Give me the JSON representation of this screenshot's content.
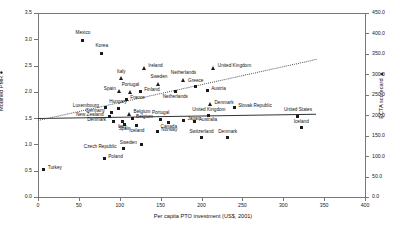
{
  "chart_data": {
    "type": "scatter",
    "title": "",
    "xlabel": "Per capita PTO investment (US$, 2001)",
    "ylabel": "Modified PMR ●",
    "y2label": "ECTA scorecard ▲",
    "xlim": [
      0,
      400
    ],
    "ylim": [
      0.0,
      3.5
    ],
    "y2lim": [
      0.0,
      450.0
    ],
    "xticks": [
      "0",
      "50",
      "100",
      "150",
      "200",
      "250",
      "300",
      "350",
      "400"
    ],
    "yticks": [
      "0.0",
      "0.5",
      "1.0",
      "1.5",
      "2.0",
      "2.5",
      "3.0",
      "3.5"
    ],
    "y2ticks": [
      "0.0",
      "50.0",
      "100.0",
      "150.0",
      "200.0",
      "250.0",
      "300.0",
      "350.0",
      "400.0",
      "450.0"
    ],
    "grid": false,
    "legend": "none",
    "series": [
      {
        "name": "Modified PMR",
        "marker": "square",
        "axis": "left",
        "points": [
          {
            "label": "Mexico",
            "x": 55,
            "y": 2.98,
            "lx": -1,
            "ly": -7
          },
          {
            "label": "Korea",
            "x": 78,
            "y": 2.73,
            "lx": -1,
            "ly": -7
          },
          {
            "label": "Finland",
            "x": 125,
            "y": 2.0,
            "lx": 4,
            "ly": -1.5
          },
          {
            "label": "Netherlands",
            "x": 168,
            "y": 2.0,
            "lx": -1,
            "ly": 5
          },
          {
            "label": "Greece",
            "x": 193,
            "y": 2.1,
            "lx": -1,
            "ly": -6
          },
          {
            "label": "Austria",
            "x": 207,
            "y": 2.02,
            "lx": 4,
            "ly": -1.5
          },
          {
            "label": "France",
            "x": 108,
            "y": 1.85,
            "lx": 4,
            "ly": -1.5
          },
          {
            "label": "Luxembourg",
            "x": 83,
            "y": 1.7,
            "lx": -33,
            "ly": -1.5
          },
          {
            "label": "Hungary",
            "x": 98,
            "y": 1.69,
            "lx": -1,
            "ly": -6
          },
          {
            "label": "Germany",
            "x": 90,
            "y": 1.6,
            "lx": -26,
            "ly": -1.5
          },
          {
            "label": "New Zealand",
            "x": 88,
            "y": 1.53,
            "lx": -34,
            "ly": -1.5
          },
          {
            "label": "Belgium",
            "x": 115,
            "y": 1.49,
            "lx": 4,
            "ly": -1.5
          },
          {
            "label": "Denmark",
            "x": 92,
            "y": 1.44,
            "lx": -26,
            "ly": -1.5
          },
          {
            "label": "Italy",
            "x": 103,
            "y": 1.43,
            "lx": -1,
            "ly": 5
          },
          {
            "label": "Spain",
            "x": 106,
            "y": 1.38,
            "lx": -1,
            "ly": 5
          },
          {
            "label": "Iceland",
            "x": 121,
            "y": 1.36,
            "lx": -1,
            "ly": 5
          },
          {
            "label": "Portugal",
            "x": 150,
            "y": 1.48,
            "lx": -1,
            "ly": -6
          },
          {
            "label": "Canada",
            "x": 160,
            "y": 1.42,
            "lx": -1,
            "ly": 5
          },
          {
            "label": "Japan",
            "x": 178,
            "y": 1.45,
            "lx": 4,
            "ly": -1.5
          },
          {
            "label": "Australia",
            "x": 192,
            "y": 1.44,
            "lx": 4,
            "ly": -1.5
          },
          {
            "label": "United Kingdom",
            "x": 209,
            "y": 1.55,
            "lx": -1,
            "ly": -6
          },
          {
            "label": "Slovak Republic",
            "x": 240,
            "y": 1.7,
            "lx": 4,
            "ly": -1.5
          },
          {
            "label": "United States",
            "x": 318,
            "y": 1.54,
            "lx": -1,
            "ly": -6
          },
          {
            "label": "Iceland",
            "x": 322,
            "y": 1.32,
            "lx": -1,
            "ly": -6
          },
          {
            "label": "Norway",
            "x": 146,
            "y": 1.24,
            "lx": 4,
            "ly": -1.5
          },
          {
            "label": "Switzerland",
            "x": 200,
            "y": 1.13,
            "lx": -1,
            "ly": -6
          },
          {
            "label": "Denmark",
            "x": 232,
            "y": 1.13,
            "lx": -1,
            "ly": -6
          },
          {
            "label": "Sweden",
            "x": 127,
            "y": 1.0,
            "lx": -22,
            "ly": -1.5
          },
          {
            "label": "Czech Republic",
            "x": 105,
            "y": 0.93,
            "lx": -40,
            "ly": -1.5
          },
          {
            "label": "Poland",
            "x": 81,
            "y": 0.73,
            "lx": 4,
            "ly": -1.5
          },
          {
            "label": "Turkey",
            "x": 7,
            "y": 0.52,
            "lx": 4,
            "ly": -1.5
          }
        ]
      },
      {
        "name": "ECTA scorecard",
        "marker": "triangle",
        "axis": "right",
        "points": [
          {
            "label": "Ireland",
            "x": 130,
            "y": 2.44,
            "lx": 4,
            "ly": -2.5
          },
          {
            "label": "Italy",
            "x": 102,
            "y": 2.25,
            "lx": -1,
            "ly": -7
          },
          {
            "label": "Sweden",
            "x": 148,
            "y": 2.14,
            "lx": -1,
            "ly": -7
          },
          {
            "label": "Netherlands",
            "x": 178,
            "y": 2.22,
            "lx": -1,
            "ly": -7
          },
          {
            "label": "Spain",
            "x": 100,
            "y": 2.0,
            "lx": -16,
            "ly": -2.5
          },
          {
            "label": "Portugal",
            "x": 113,
            "y": 1.99,
            "lx": -1,
            "ly": -7
          },
          {
            "label": "Belgium",
            "x": 112,
            "y": 1.56,
            "lx": 4,
            "ly": -2.5
          },
          {
            "label": "Denmark",
            "x": 211,
            "y": 1.75,
            "lx": 4,
            "ly": -2.5
          },
          {
            "label": "United Kingdom",
            "x": 215,
            "y": 2.45,
            "lx": 4,
            "ly": -2.5
          }
        ]
      }
    ],
    "trendlines": [
      {
        "name": "pmr-trend",
        "style": "solid",
        "x0": 0,
        "y0": 1.5,
        "x1": 340,
        "y1": 1.58
      },
      {
        "name": "ecta-trend",
        "style": "dotted",
        "x0": 0,
        "y0": 1.46,
        "x1": 340,
        "y1": 2.62
      }
    ]
  }
}
